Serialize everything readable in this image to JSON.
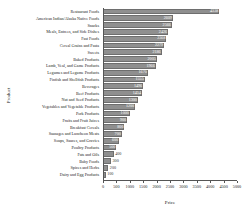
{
  "chart_data": {
    "type": "bar",
    "orientation": "horizontal",
    "title": "",
    "xlabel": "Price",
    "ylabel": "Product",
    "xlim": [
      0,
      5000
    ],
    "ylim": null,
    "grid": false,
    "legend": null,
    "xticks": [
      0,
      500,
      1000,
      1500,
      2000,
      2500,
      3000,
      3500,
      4000,
      4500,
      5000
    ],
    "xticklabels": [
      "0",
      "500",
      "1000",
      "1500",
      "2000",
      "2500",
      "3000",
      "3500",
      "4000",
      "4500",
      "5000"
    ],
    "bar_color": "#8f8f8f",
    "categories": [
      "Restaurant Foods",
      "American Indian/Alaska Native Foods",
      "Snacks",
      "Meals, Entrees, and Side Dishes",
      "Fast Foods",
      "Cereal Grains and Pasta",
      "Sweets",
      "Baked Products",
      "Lamb, Veal, and Game Products",
      "Legumes and Legume Products",
      "Finfish and Shellfish Products",
      "Beverages",
      "Beef Products",
      "Nut and Seed Products",
      "Vegetables and Vegetable Products",
      "Pork Products",
      "Fruits and Fruit Juices",
      "Breakfast Cereals",
      "Sausages and Luncheon Meats",
      "Soups, Sauces, and Gravies",
      "Poultry Products",
      "Fats and Oils",
      "Baby Foods",
      "Spices and Herbs",
      "Dairy and Egg Products"
    ],
    "values": [
      4338,
      2609,
      2566,
      2426,
      2368,
      2279,
      2186,
      2005,
      1966,
      1670,
      1555,
      1496,
      1454,
      1300,
      1200,
      1000,
      900,
      800,
      700,
      600,
      500,
      400,
      300,
      200,
      100
    ],
    "value_labels": [
      "4338",
      "2609",
      "2566",
      "2426",
      "2368",
      "2279",
      "2186",
      "2005",
      "1966",
      "1670",
      "1555",
      "1496",
      "1454",
      "1300",
      "1200",
      "1000",
      "900",
      "800",
      "700",
      "600",
      "500",
      "400",
      "300",
      "200",
      "100"
    ]
  }
}
